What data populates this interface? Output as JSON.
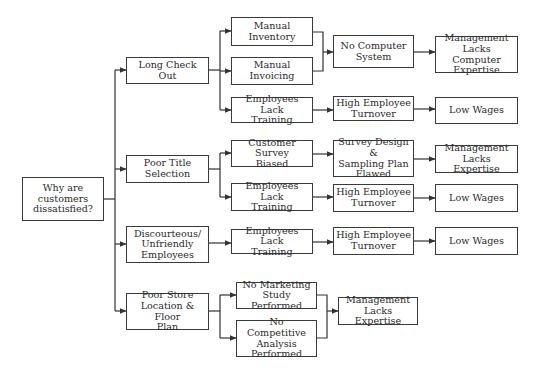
{
  "diagram": {
    "type": "cause-and-effect tree",
    "root": {
      "id": "root",
      "label": "Why are\ncustomers\ndissatisfied?"
    },
    "nodes": [
      {
        "id": "long-check-out",
        "label": "Long Check Out"
      },
      {
        "id": "manual-inventory",
        "label": "Manual\nInventory"
      },
      {
        "id": "manual-invoicing",
        "label": "Manual\nInvoicing"
      },
      {
        "id": "no-computer-system",
        "label": "No Computer\nSystem"
      },
      {
        "id": "mgmt-lacks-computer-expertise",
        "label": "Management\nLacks Computer\nExpertise"
      },
      {
        "id": "employees-lack-training-1",
        "label": "Employees Lack\nTraining"
      },
      {
        "id": "high-employee-turnover-1",
        "label": "High Employee\nTurnover"
      },
      {
        "id": "low-wages-1",
        "label": "Low Wages"
      },
      {
        "id": "poor-title-selection",
        "label": "Poor Title\nSelection"
      },
      {
        "id": "customer-survey-biased",
        "label": "Customer Survey\nBiased"
      },
      {
        "id": "survey-design-flawed",
        "label": "Survey Design &\nSampling Plan\nFlawed"
      },
      {
        "id": "mgmt-lacks-expertise-1",
        "label": "Management\nLacks Expertise"
      },
      {
        "id": "employees-lack-training-2",
        "label": "Employees Lack\nTraining"
      },
      {
        "id": "high-employee-turnover-2",
        "label": "High Employee\nTurnover"
      },
      {
        "id": "low-wages-2",
        "label": "Low Wages"
      },
      {
        "id": "discourteous-employees",
        "label": "Discourteous/\nUnfriendly\nEmployees"
      },
      {
        "id": "employees-lack-training-3",
        "label": "Employees Lack\nTraining"
      },
      {
        "id": "high-employee-turnover-3",
        "label": "High Employee\nTurnover"
      },
      {
        "id": "low-wages-3",
        "label": "Low Wages"
      },
      {
        "id": "poor-store-location",
        "label": "Poor Store\nLocation & Floor\nPlan"
      },
      {
        "id": "no-marketing-study",
        "label": "No Marketing\nStudy Performed"
      },
      {
        "id": "no-competitive-analysis",
        "label": "No Competitive\nAnalysis\nPerformed"
      },
      {
        "id": "mgmt-lacks-expertise-2",
        "label": "Management\nLacks Expertise"
      }
    ],
    "edges": [
      [
        "root",
        "long-check-out"
      ],
      [
        "root",
        "poor-title-selection"
      ],
      [
        "root",
        "discourteous-employees"
      ],
      [
        "root",
        "poor-store-location"
      ],
      [
        "long-check-out",
        "manual-inventory"
      ],
      [
        "long-check-out",
        "manual-invoicing"
      ],
      [
        "long-check-out",
        "employees-lack-training-1"
      ],
      [
        "manual-inventory",
        "no-computer-system"
      ],
      [
        "manual-invoicing",
        "no-computer-system"
      ],
      [
        "no-computer-system",
        "mgmt-lacks-computer-expertise"
      ],
      [
        "employees-lack-training-1",
        "high-employee-turnover-1"
      ],
      [
        "high-employee-turnover-1",
        "low-wages-1"
      ],
      [
        "poor-title-selection",
        "customer-survey-biased"
      ],
      [
        "poor-title-selection",
        "employees-lack-training-2"
      ],
      [
        "customer-survey-biased",
        "survey-design-flawed"
      ],
      [
        "survey-design-flawed",
        "mgmt-lacks-expertise-1"
      ],
      [
        "employees-lack-training-2",
        "high-employee-turnover-2"
      ],
      [
        "high-employee-turnover-2",
        "low-wages-2"
      ],
      [
        "discourteous-employees",
        "employees-lack-training-3"
      ],
      [
        "employees-lack-training-3",
        "high-employee-turnover-3"
      ],
      [
        "high-employee-turnover-3",
        "low-wages-3"
      ],
      [
        "poor-store-location",
        "no-marketing-study"
      ],
      [
        "poor-store-location",
        "no-competitive-analysis"
      ],
      [
        "no-marketing-study",
        "mgmt-lacks-expertise-2"
      ],
      [
        "no-competitive-analysis",
        "mgmt-lacks-expertise-2"
      ]
    ]
  },
  "labels": {
    "root": "Why are\ncustomers\ndissatisfied?",
    "long_check_out": "Long Check Out",
    "manual_inventory": "Manual\nInventory",
    "manual_invoicing": "Manual\nInvoicing",
    "no_computer_system": "No Computer\nSystem",
    "mgmt_lacks_computer_expertise": "Management\nLacks Computer\nExpertise",
    "employees_lack_training_1": "Employees Lack\nTraining",
    "high_employee_turnover_1": "High Employee\nTurnover",
    "low_wages_1": "Low Wages",
    "poor_title_selection": "Poor Title\nSelection",
    "customer_survey_biased": "Customer Survey\nBiased",
    "survey_design_flawed": "Survey Design &\nSampling Plan\nFlawed",
    "mgmt_lacks_expertise_1": "Management\nLacks Expertise",
    "employees_lack_training_2": "Employees Lack\nTraining",
    "high_employee_turnover_2": "High Employee\nTurnover",
    "low_wages_2": "Low Wages",
    "discourteous_employees": "Discourteous/\nUnfriendly\nEmployees",
    "employees_lack_training_3": "Employees Lack\nTraining",
    "high_employee_turnover_3": "High Employee\nTurnover",
    "low_wages_3": "Low Wages",
    "poor_store_location": "Poor Store\nLocation & Floor\nPlan",
    "no_marketing_study": "No Marketing\nStudy Performed",
    "no_competitive_analysis": "No Competitive\nAnalysis\nPerformed",
    "mgmt_lacks_expertise_2": "Management\nLacks Expertise"
  },
  "colors": {
    "line": "#333333",
    "box_border": "#3a3a3a",
    "text": "#2a2a2a",
    "background": "#ffffff"
  }
}
